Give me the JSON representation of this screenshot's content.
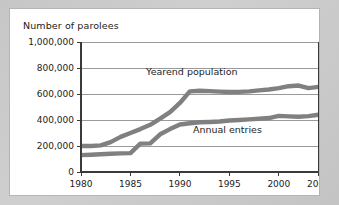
{
  "figure": {
    "title": "Number of parolees",
    "background_color": "#c9c9c9",
    "panel_color": "#ffffff",
    "line_color": "#808080",
    "grid_color": "#6f6f6f",
    "axis_color": "#3a3a3a"
  },
  "chart_data": {
    "type": "line",
    "title": "Number of parolees",
    "xlabel": "",
    "ylabel": "",
    "xlim": [
      1980,
      2004
    ],
    "ylim": [
      0,
      1000000
    ],
    "grid": true,
    "legend": "inline-annotations",
    "x_ticks": [
      "1980",
      "1985",
      "1990",
      "1995",
      "2000",
      "2004"
    ],
    "x_tick_values": [
      1980,
      1985,
      1990,
      1995,
      2000,
      2004
    ],
    "y_ticks": [
      "0",
      "200,000",
      "400,000",
      "600,000",
      "800,000",
      "1,000,000"
    ],
    "y_tick_values": [
      0,
      200000,
      400000,
      600000,
      800000,
      1000000
    ],
    "x": [
      1980,
      1981,
      1982,
      1983,
      1984,
      1985,
      1986,
      1987,
      1988,
      1989,
      1990,
      1991,
      1992,
      1993,
      1994,
      1995,
      1996,
      1997,
      1998,
      1999,
      2000,
      2001,
      2002,
      2003,
      2004
    ],
    "series": [
      {
        "name": "Yearend population",
        "label": "Yearend population",
        "color": "#808080",
        "values": [
          200000,
          200000,
          205000,
          230000,
          270000,
          300000,
          330000,
          363000,
          410000,
          460000,
          531000,
          620000,
          625000,
          622000,
          618000,
          615000,
          616000,
          620000,
          628000,
          635000,
          645000,
          660000,
          665000,
          645000,
          655000
        ]
      },
      {
        "name": "Annual entries",
        "label": "Annual entries",
        "color": "#808080",
        "values": [
          130000,
          133000,
          137000,
          140000,
          143000,
          145000,
          218000,
          220000,
          290000,
          330000,
          365000,
          375000,
          383000,
          385000,
          388000,
          396000,
          400000,
          405000,
          410000,
          415000,
          432000,
          428000,
          425000,
          430000,
          440000
        ]
      }
    ],
    "annotations": [
      {
        "text": "Yearend population",
        "x": 1991.2,
        "y": 745000
      },
      {
        "text": "Annual entries",
        "x": 1994.8,
        "y": 300000
      }
    ]
  }
}
